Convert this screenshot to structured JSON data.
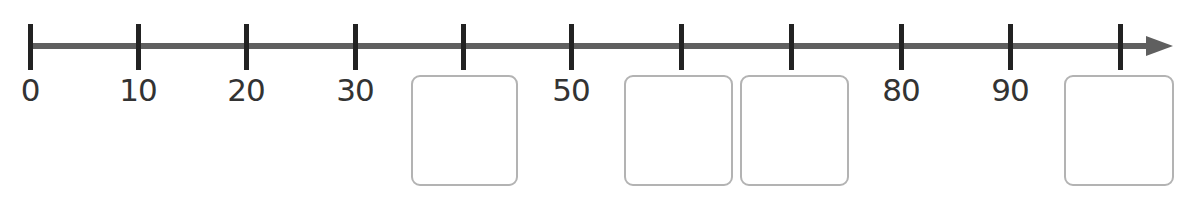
{
  "number_line": {
    "start": 0,
    "end": 100,
    "step": 10,
    "axis_color": "#5f5f5f",
    "tick_color": "#222222",
    "box_border_color": "#b3b3b3",
    "ticks": [
      {
        "value": 0,
        "x": 30,
        "label": "0",
        "blank": false
      },
      {
        "value": 10,
        "x": 138,
        "label": "10",
        "blank": false
      },
      {
        "value": 20,
        "x": 246,
        "label": "20",
        "blank": false
      },
      {
        "value": 30,
        "x": 355,
        "label": "30",
        "blank": false
      },
      {
        "value": 40,
        "x": 463,
        "label": "",
        "blank": true,
        "box": {
          "left": 411,
          "width": 107
        }
      },
      {
        "value": 50,
        "x": 571,
        "label": "50",
        "blank": false
      },
      {
        "value": 60,
        "x": 681,
        "label": "",
        "blank": true,
        "box": {
          "left": 624,
          "width": 109
        }
      },
      {
        "value": 70,
        "x": 791,
        "label": "",
        "blank": true,
        "box": {
          "left": 740,
          "width": 109
        }
      },
      {
        "value": 80,
        "x": 901,
        "label": "80",
        "blank": false
      },
      {
        "value": 90,
        "x": 1010,
        "label": "90",
        "blank": false
      },
      {
        "value": 100,
        "x": 1120,
        "label": "",
        "blank": true,
        "box": {
          "left": 1064,
          "width": 110
        }
      }
    ]
  }
}
